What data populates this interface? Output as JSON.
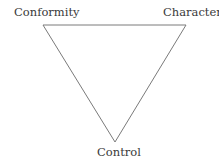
{
  "diagram": {
    "type": "triangle",
    "vertices": {
      "top_left": "Conformity",
      "top_right": "Character",
      "bottom": "Control"
    },
    "edges": [
      {
        "from": "Conformity",
        "to": "Character"
      },
      {
        "from": "Character",
        "to": "Control"
      },
      {
        "from": "Control",
        "to": "Conformity"
      }
    ],
    "stroke_color": "#7a7a7a",
    "text_color": "#3a3a3a"
  }
}
